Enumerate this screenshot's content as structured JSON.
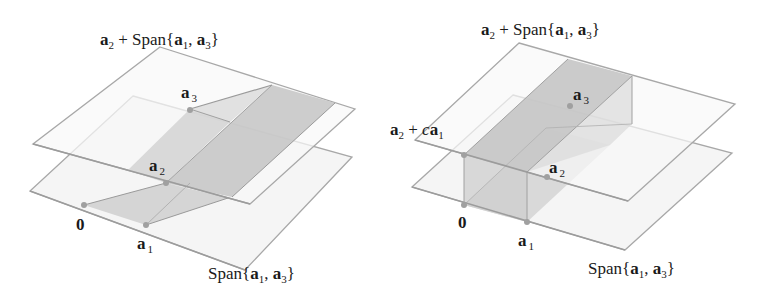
{
  "figures": [
    {
      "id": "left",
      "top_plane_label": {
        "a": "a",
        "sub_a": "2",
        "plus": " + Span{",
        "b1": "a",
        "sub_b1": "1",
        "comma": ", ",
        "b2": "a",
        "sub_b2": "3",
        "close": "}"
      },
      "bottom_plane_label": {
        "pre": "Span{",
        "b1": "a",
        "sub_b1": "1",
        "comma": ", ",
        "b2": "a",
        "sub_b2": "3",
        "close": "}"
      },
      "points": [
        {
          "name": "0",
          "label": "0",
          "sub": ""
        },
        {
          "name": "a1",
          "label": "a",
          "sub": "1"
        },
        {
          "name": "a2",
          "label": "a",
          "sub": "2"
        },
        {
          "name": "a3",
          "label": "a",
          "sub": "3"
        }
      ]
    },
    {
      "id": "right",
      "top_plane_label": {
        "a": "a",
        "sub_a": "2",
        "plus": " + Span{",
        "b1": "a",
        "sub_b1": "1",
        "comma": ", ",
        "b2": "a",
        "sub_b2": "3",
        "close": "}"
      },
      "bottom_plane_label": {
        "pre": "Span{",
        "b1": "a",
        "sub_b1": "1",
        "comma": ", ",
        "b2": "a",
        "sub_b2": "3",
        "close": "}"
      },
      "line_label": {
        "a": "a",
        "sub_a": "2",
        "plus": " + ",
        "c": "c",
        "b": "a",
        "sub_b": "1"
      },
      "points": [
        {
          "name": "0",
          "label": "0",
          "sub": ""
        },
        {
          "name": "a1",
          "label": "a",
          "sub": "1"
        },
        {
          "name": "a2",
          "label": "a",
          "sub": "2"
        },
        {
          "name": "a3",
          "label": "a",
          "sub": "3"
        }
      ]
    }
  ],
  "colors": {
    "plane_fill": "#f4f4f4",
    "plane_edge": "#a8a8a8",
    "shade_light": "#d6d6d6",
    "shade_dark": "#c2c2c2",
    "point": "#a0a0a0",
    "text": "#1a1a1a"
  }
}
